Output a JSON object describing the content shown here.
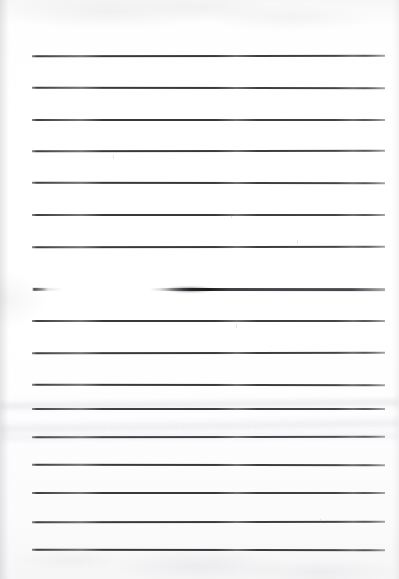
{
  "document": {
    "kind": "scanned-lined-notebook-page",
    "title": "Blank ruled notebook page (scan)",
    "page_width": 399,
    "page_height": 579,
    "paper_color": "#fdfdfd",
    "rule_color": "#2e2e32",
    "content_text": "",
    "handwriting_present": "none"
  },
  "ruling": {
    "left_margin_x": 32,
    "right_margin_x": 385,
    "line_length": 353,
    "line_spacing": 31.8,
    "line_count": 16,
    "first_line_y": 55,
    "last_line_y": 549,
    "lines": [
      {
        "index": 1,
        "y": 55,
        "state": "normal"
      },
      {
        "index": 2,
        "y": 87,
        "state": "normal"
      },
      {
        "index": 3,
        "y": 119,
        "state": "normal"
      },
      {
        "index": 4,
        "y": 150,
        "state": "normal"
      },
      {
        "index": 5,
        "y": 182,
        "state": "normal"
      },
      {
        "index": 6,
        "y": 214,
        "state": "normal"
      },
      {
        "index": 7,
        "y": 246,
        "state": "normal"
      },
      {
        "index": 8,
        "y": 256,
        "state": "normal"
      },
      {
        "index": 9,
        "y": 288,
        "state": "faded-erased"
      },
      {
        "index": 10,
        "y": 320,
        "state": "normal"
      },
      {
        "index": 11,
        "y": 352,
        "state": "normal"
      },
      {
        "index": 12,
        "y": 384,
        "state": "normal"
      },
      {
        "index": 13,
        "y": 408,
        "state": "normal"
      },
      {
        "index": 14,
        "y": 436,
        "state": "normal"
      },
      {
        "index": 15,
        "y": 464,
        "state": "normal"
      },
      {
        "index": 16,
        "y": 492,
        "state": "normal"
      },
      {
        "index": 17,
        "y": 521,
        "state": "normal"
      },
      {
        "index": 18,
        "y": 549,
        "state": "normal"
      }
    ]
  },
  "artifacts": {
    "smudge": {
      "label": "dark pencil smudge on faded line",
      "x": 160,
      "y": 288,
      "width": 60,
      "height": 5
    },
    "left_stub": {
      "label": "short dark stub at left of faded line",
      "x": 32,
      "y": 288,
      "width": 14
    },
    "creases": [
      {
        "label": "fold shadow band upper",
        "y": 398
      },
      {
        "label": "fold shadow band middle",
        "y": 418
      },
      {
        "label": "fold shadow band lower",
        "y": 432
      }
    ],
    "edge_shadows": [
      "left",
      "right"
    ],
    "flecks": [
      {
        "x": 231,
        "y": 214
      },
      {
        "x": 236,
        "y": 324
      },
      {
        "x": 320,
        "y": 519
      },
      {
        "x": 113,
        "y": 155
      },
      {
        "x": 297,
        "y": 240
      }
    ]
  }
}
